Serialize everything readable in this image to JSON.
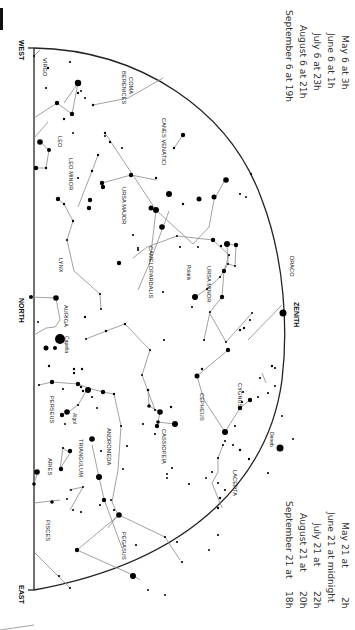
{
  "chart": {
    "type": "star-chart",
    "orientation": "rotated-90-clockwise",
    "directions": {
      "west": "WEST",
      "north": "NORTH",
      "east": "EAST",
      "zenith": "ZENITH"
    },
    "times_top": [
      "May 6 at  3h",
      "June 6 at  1h",
      "July 6 at 23h",
      "August 6 at 21h",
      "September 6 at 19h"
    ],
    "times_bottom": [
      {
        "date": "May 21 at",
        "time": "2h"
      },
      {
        "date": "June 21 at midnight",
        "time": ""
      },
      {
        "date": "July 21 at",
        "time": "22h"
      },
      {
        "date": "August 21 at",
        "time": "20h"
      },
      {
        "date": "September 21 at",
        "time": "18h"
      }
    ],
    "constellations": {
      "virgo": "VIRGO",
      "coma_berenices_1": "COMA",
      "coma_berenices_2": "BERENICES",
      "leo": "LEO",
      "leo_minor": "LEO MINOR",
      "canes_venatici": "CANES VENATICI",
      "ursa_major": "URSA MAJOR",
      "lynx": "LYNX",
      "auriga": "AURIGA",
      "camelopardalis": "CAMELOPARDALIS",
      "ursa_minor": "URSA MINOR",
      "draco": "DRACO",
      "cygnus": "CYGNUS",
      "cepheus": "CEPHEUS",
      "cassiopeia": "CASSIOPEIA",
      "lacerta": "LACERTA",
      "perseus": "PERSEUS",
      "andromeda": "ANDROMEDA",
      "triangulum": "TRIANGULUM",
      "aries": "ARIES",
      "pisces": "PISCES",
      "pegasus": "PEGASUS"
    },
    "stars": {
      "capella": "Capella",
      "polaris": "Polaris",
      "algol": "Algol",
      "deneb": "Deneb"
    }
  }
}
